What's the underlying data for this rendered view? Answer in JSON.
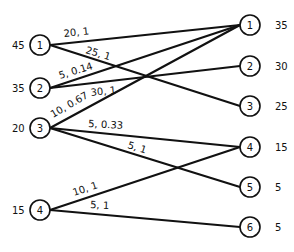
{
  "diagram": {
    "type": "bipartite-transportation-network",
    "sources": [
      {
        "id": "1",
        "supply": "45"
      },
      {
        "id": "2",
        "supply": "35"
      },
      {
        "id": "3",
        "supply": "20"
      },
      {
        "id": "4",
        "supply": "15"
      }
    ],
    "sinks": [
      {
        "id": "1",
        "demand": "35"
      },
      {
        "id": "2",
        "demand": "30"
      },
      {
        "id": "3",
        "demand": "25"
      },
      {
        "id": "4",
        "demand": "15"
      },
      {
        "id": "5",
        "demand": "5"
      },
      {
        "id": "6",
        "demand": "5"
      }
    ],
    "edges": [
      {
        "from": "1",
        "to": "1",
        "label": "20, 1"
      },
      {
        "from": "1",
        "to": "3",
        "label": "25, 1"
      },
      {
        "from": "2",
        "to": "2",
        "label": "5, 0.14"
      },
      {
        "from": "2",
        "to": "1",
        "label": "30, 1"
      },
      {
        "from": "3",
        "to": "1",
        "label": "10, 0.67"
      },
      {
        "from": "3",
        "to": "4",
        "label": "5, 0.33"
      },
      {
        "from": "3",
        "to": "5",
        "label": "5, 1"
      },
      {
        "from": "4",
        "to": "4",
        "label": "10, 1"
      },
      {
        "from": "4",
        "to": "6",
        "label": "5, 1"
      }
    ]
  }
}
